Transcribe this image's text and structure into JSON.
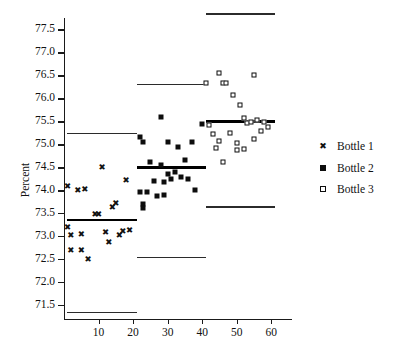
{
  "chart_data": {
    "type": "scatter",
    "title": "",
    "xlabel": "",
    "ylabel": "Percent",
    "xlim": [
      0,
      66
    ],
    "ylim": [
      71.2,
      77.75
    ],
    "grid": false,
    "legend_position": "right",
    "xticks": [
      10,
      20,
      30,
      40,
      50,
      60
    ],
    "yticks": [
      71.5,
      72.0,
      72.5,
      73.0,
      73.5,
      74.0,
      74.5,
      75.0,
      75.5,
      76.0,
      76.5,
      77.0,
      77.5
    ],
    "ytick_labels": [
      "71.5",
      "72.0",
      "72.5",
      "73.0",
      "73.5",
      "74.0",
      "74.5",
      "75.0",
      "75.5",
      "76.0",
      "76.5",
      "77.0",
      "77.5"
    ],
    "xtick_labels": [
      "10",
      "20",
      "30",
      "40",
      "50",
      "60"
    ],
    "series": [
      {
        "name": "Bottle 1",
        "marker": "x",
        "center_line": 73.35,
        "upper_limit": 75.25,
        "lower_limit": 71.35,
        "x_range": [
          1,
          21
        ],
        "points": [
          {
            "x": 1,
            "y": 74.1
          },
          {
            "x": 1,
            "y": 73.2
          },
          {
            "x": 2,
            "y": 73.03
          },
          {
            "x": 2,
            "y": 72.7
          },
          {
            "x": 4,
            "y": 74.0
          },
          {
            "x": 5,
            "y": 73.05
          },
          {
            "x": 5,
            "y": 72.7
          },
          {
            "x": 6,
            "y": 74.03
          },
          {
            "x": 7,
            "y": 72.5
          },
          {
            "x": 9,
            "y": 73.48
          },
          {
            "x": 10,
            "y": 73.48
          },
          {
            "x": 11,
            "y": 74.5
          },
          {
            "x": 12,
            "y": 73.1
          },
          {
            "x": 13,
            "y": 72.88
          },
          {
            "x": 14,
            "y": 73.63
          },
          {
            "x": 15,
            "y": 73.72
          },
          {
            "x": 16,
            "y": 73.02
          },
          {
            "x": 17,
            "y": 73.12
          },
          {
            "x": 18,
            "y": 74.22
          },
          {
            "x": 19,
            "y": 73.13
          }
        ]
      },
      {
        "name": "Bottle 2",
        "marker": "filled-square",
        "center_line": 74.5,
        "upper_limit": 76.32,
        "lower_limit": 72.55,
        "x_range": [
          21,
          41
        ],
        "points": [
          {
            "x": 22,
            "y": 75.15
          },
          {
            "x": 22,
            "y": 73.97
          },
          {
            "x": 23,
            "y": 75.05
          },
          {
            "x": 23,
            "y": 73.7
          },
          {
            "x": 23,
            "y": 73.62
          },
          {
            "x": 24,
            "y": 73.97
          },
          {
            "x": 25,
            "y": 74.62
          },
          {
            "x": 26,
            "y": 74.2
          },
          {
            "x": 27,
            "y": 73.88
          },
          {
            "x": 28,
            "y": 74.55
          },
          {
            "x": 28,
            "y": 75.6
          },
          {
            "x": 29,
            "y": 74.18
          },
          {
            "x": 29,
            "y": 73.9
          },
          {
            "x": 30,
            "y": 75.05
          },
          {
            "x": 30,
            "y": 74.35
          },
          {
            "x": 31,
            "y": 74.25
          },
          {
            "x": 32,
            "y": 74.4
          },
          {
            "x": 33,
            "y": 74.95
          },
          {
            "x": 34,
            "y": 74.28
          },
          {
            "x": 35,
            "y": 74.65
          },
          {
            "x": 36,
            "y": 74.25
          },
          {
            "x": 37,
            "y": 75.05
          },
          {
            "x": 38,
            "y": 74.0
          },
          {
            "x": 40,
            "y": 75.45
          }
        ]
      },
      {
        "name": "Bottle 3",
        "marker": "open-square",
        "center_line": 75.5,
        "upper_limit": 77.85,
        "lower_limit": 73.65,
        "x_range": [
          41,
          61
        ],
        "points": [
          {
            "x": 41,
            "y": 76.33
          },
          {
            "x": 42,
            "y": 75.42
          },
          {
            "x": 43,
            "y": 75.22
          },
          {
            "x": 44,
            "y": 74.92
          },
          {
            "x": 45,
            "y": 76.55
          },
          {
            "x": 45,
            "y": 75.08
          },
          {
            "x": 46,
            "y": 76.33
          },
          {
            "x": 46,
            "y": 74.62
          },
          {
            "x": 47,
            "y": 76.33
          },
          {
            "x": 48,
            "y": 75.25
          },
          {
            "x": 49,
            "y": 76.08
          },
          {
            "x": 50,
            "y": 75.02
          },
          {
            "x": 50,
            "y": 74.88
          },
          {
            "x": 51,
            "y": 75.85
          },
          {
            "x": 52,
            "y": 74.9
          },
          {
            "x": 52,
            "y": 75.58
          },
          {
            "x": 53,
            "y": 75.47
          },
          {
            "x": 54,
            "y": 75.48
          },
          {
            "x": 55,
            "y": 75.12
          },
          {
            "x": 55,
            "y": 76.5
          },
          {
            "x": 56,
            "y": 75.52
          },
          {
            "x": 57,
            "y": 75.3
          },
          {
            "x": 58,
            "y": 75.48
          },
          {
            "x": 59,
            "y": 75.38
          }
        ]
      }
    ]
  },
  "legend": {
    "items": [
      {
        "label": "Bottle 1",
        "marker": "x"
      },
      {
        "label": "Bottle 2",
        "marker": "filled-square"
      },
      {
        "label": "Bottle 3",
        "marker": "open-square"
      }
    ]
  }
}
